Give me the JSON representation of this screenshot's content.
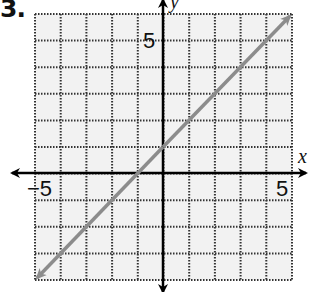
{
  "problem": {
    "number": "3."
  },
  "chart_data": {
    "type": "line",
    "title": "",
    "xlabel": "x",
    "ylabel": "y",
    "xlim": [
      -5,
      5
    ],
    "ylim": [
      -4,
      6
    ],
    "grid": true,
    "grid_style": "dotted",
    "tick_labels": {
      "x": [
        "-5",
        "5"
      ],
      "y": [
        "5"
      ]
    },
    "series": [
      {
        "name": "line",
        "equation": "y = x + 1",
        "slope": 1,
        "y_intercept": 1,
        "x_intercept": -1,
        "x": [
          -5,
          -1,
          0,
          5
        ],
        "y": [
          -4,
          0,
          1,
          6
        ],
        "arrows_both_ends": true,
        "color": "#8c8c8c"
      }
    ]
  },
  "labels": {
    "x_axis": "x",
    "y_axis": "y",
    "x_min_tick": "−5",
    "x_max_tick": "5",
    "y_max_tick": "5"
  },
  "colors": {
    "grid": "#333333",
    "axis": "#000000",
    "line": "#8c8c8c",
    "background": "#f2f2f2"
  }
}
